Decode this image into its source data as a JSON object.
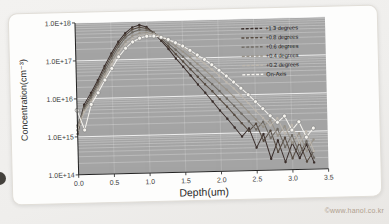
{
  "page": {
    "watermark": "©www.hanol.co.kr"
  },
  "chart_data": {
    "type": "scatter",
    "title": "",
    "xlabel": "Depth(um)",
    "ylabel": "Concentration(cm⁻³)",
    "xlim": [
      0,
      3.5
    ],
    "ylog": true,
    "ylim": [
      100000000000000.0,
      1e+18
    ],
    "x_ticks": [
      "0.0",
      "0.5",
      "1.0",
      "1.5",
      "2.0",
      "2.5",
      "3.0",
      "3.5"
    ],
    "y_ticks": [
      "1.0E+18",
      "1.0E+17",
      "1.0E+16",
      "1.0E+15",
      "1.0E+14"
    ],
    "grid": "on",
    "legend_position": "top-right",
    "plot_bg": "#a4a4a4",
    "grid_color": "#ffffff",
    "x": [
      0.0,
      0.1,
      0.2,
      0.3,
      0.4,
      0.5,
      0.6,
      0.7,
      0.8,
      0.9,
      1.0,
      1.1,
      1.2,
      1.3,
      1.4,
      1.5,
      1.6,
      1.7,
      1.8,
      1.9,
      2.0,
      2.1,
      2.2,
      2.3,
      2.4,
      2.5,
      2.6,
      2.7,
      2.8,
      2.9,
      3.0,
      3.1,
      3.2,
      3.3
    ],
    "series": [
      {
        "name": "+1.3 degrees",
        "color": "#3a2e2b",
        "values": [
          1500000000000000.0,
          7000000000000000.0,
          1.4e+16,
          3e+16,
          7e+16,
          1.5e+17,
          3e+17,
          5e+17,
          7e+17,
          8e+17,
          7e+17,
          4.8e+17,
          3e+17,
          1.8e+17,
          1e+17,
          6e+16,
          3.5e+16,
          2e+16,
          1.2e+16,
          7000000000000000.0,
          4000000000000000.0,
          2400000000000000.0,
          1400000000000000.0,
          800000000000000.0,
          1300000000000000.0,
          400000000000000.0,
          900000000000000.0,
          200000000000000.0,
          600000000000000.0,
          160000000000000.0,
          500000000000000.0,
          200000000000000.0,
          450000000000000.0,
          150000000000000.0
        ]
      },
      {
        "name": "+0.8 degrees",
        "color": "#554a40",
        "values": [
          1200000000000000.0,
          6000000000000000.0,
          1.2e+16,
          2.6e+16,
          6e+16,
          1.3e+17,
          2.6e+17,
          4.4e+17,
          6.2e+17,
          7e+17,
          6.4e+17,
          4.9e+17,
          3.3e+17,
          2.1e+17,
          1.3e+17,
          8.2e+16,
          5.1e+16,
          3.2e+16,
          2e+16,
          1.3e+16,
          8000000000000000.0,
          5000000000000000.0,
          3000000000000000.0,
          1800000000000000.0,
          1100000000000000.0,
          1700000000000000.0,
          600000000000000.0,
          1100000000000000.0,
          300000000000000.0,
          700000000000000.0,
          200000000000000.0,
          500000000000000.0,
          160000000000000.0,
          300000000000000.0
        ]
      },
      {
        "name": "+0.6 degrees",
        "color": "#6f6a63",
        "values": [
          2000000000000000.0,
          5500000000000000.0,
          1.05e+16,
          2.3e+16,
          5e+16,
          1.1e+17,
          2.2e+17,
          3.8e+17,
          5.2e+17,
          6e+17,
          5.8e+17,
          4.9e+17,
          3.6e+17,
          2.5e+17,
          1.7e+17,
          1.1e+17,
          7.2e+16,
          4.7e+16,
          3e+16,
          2e+16,
          1.3e+16,
          8200000000000000.0,
          5200000000000000.0,
          3200000000000000.0,
          2000000000000000.0,
          1200000000000000.0,
          1900000000000000.0,
          700000000000000.0,
          1200000000000000.0,
          400000000000000.0,
          800000000000000.0,
          260000000000000.0,
          550000000000000.0,
          200000000000000.0
        ]
      },
      {
        "name": "+0.4 degrees",
        "color": "#989288",
        "values": [
          1800000000000000.0,
          5000000000000000.0,
          9000000000000000.0,
          2e+16,
          4.2e+16,
          9e+16,
          1.8e+17,
          3e+17,
          4.2e+17,
          4.9e+17,
          5e+17,
          4.6e+17,
          3.8e+17,
          2.9e+17,
          2.1e+17,
          1.5e+17,
          1.05e+17,
          7e+16,
          4.8e+16,
          3.2e+16,
          2.1e+16,
          1.4e+16,
          9000000000000000.0,
          5600000000000000.0,
          3500000000000000.0,
          2200000000000000.0,
          1400000000000000.0,
          2100000000000000.0,
          800000000000000.0,
          1400000000000000.0,
          500000000000000.0,
          900000000000000.0,
          300000000000000.0,
          600000000000000.0
        ]
      },
      {
        "name": "+0.2 degrees",
        "color": "#bdb7ae",
        "values": [
          1500000000000000.0,
          4500000000000000.0,
          8000000000000000.0,
          1.7e+16,
          3.6e+16,
          7.5e+16,
          1.5e+17,
          2.5e+17,
          3.5e+17,
          4.2e+17,
          4.5e+17,
          4.4e+17,
          3.9e+17,
          3.2e+17,
          2.5e+17,
          1.9e+17,
          1.4e+17,
          1e+17,
          7.1e+16,
          4.9e+16,
          3.3e+16,
          2.2e+16,
          1.5e+16,
          9600000000000000.0,
          6000000000000000.0,
          3800000000000000.0,
          2400000000000000.0,
          1500000000000000.0,
          2300000000000000.0,
          900000000000000.0,
          1500000000000000.0,
          500000000000000.0,
          1000000000000000.0,
          300000000000000.0
        ]
      },
      {
        "name": "On-Axis",
        "color": "#f6f4ef",
        "marker_stroke": "#7d7d7d",
        "values": [
          5000000000000000.0,
          1500000000000000.0,
          7000000000000000.0,
          1.4e+16,
          3e+16,
          6e+16,
          1.2e+17,
          2e+17,
          2.9e+17,
          3.6e+17,
          4e+17,
          4e+17,
          3.7e+17,
          3.2e+17,
          2.6e+17,
          2.1e+17,
          1.6e+17,
          1.2e+17,
          9e+16,
          6.5e+16,
          4.6e+16,
          3.2e+16,
          2.2e+16,
          1.5e+16,
          1e+16,
          6500000000000000.0,
          4200000000000000.0,
          2700000000000000.0,
          1800000000000000.0,
          2600000000000000.0,
          1100000000000000.0,
          1800000000000000.0,
          700000000000000.0,
          1200000000000000.0
        ]
      }
    ]
  }
}
